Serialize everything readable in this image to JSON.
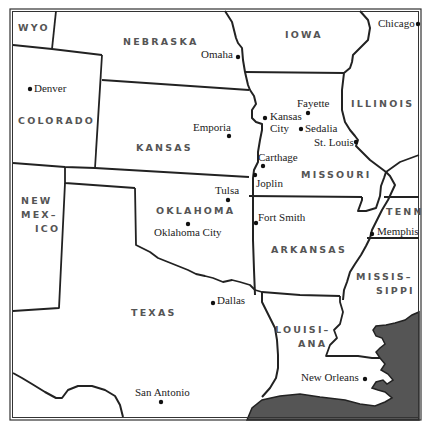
{
  "map": {
    "title": "South-Central United States",
    "colors": {
      "land": "#ffffff",
      "water": "#555555",
      "lines": "#222222",
      "state_label": "#555555"
    },
    "states": [
      {
        "name": "WYO",
        "lines": [
          "WYO"
        ]
      },
      {
        "name": "NEBRASKA",
        "lines": [
          "NEBRASKA"
        ]
      },
      {
        "name": "IOWA",
        "lines": [
          "IOWA"
        ]
      },
      {
        "name": "COLORADO",
        "lines": [
          "COLORADO"
        ]
      },
      {
        "name": "KANSAS",
        "lines": [
          "KANSAS"
        ]
      },
      {
        "name": "ILLINOIS",
        "lines": [
          "ILLINOIS"
        ]
      },
      {
        "name": "MISSOURI",
        "lines": [
          "MISSOURI"
        ]
      },
      {
        "name": "NEW MEXICO",
        "lines": [
          "NEW",
          "MEX–",
          "ICO"
        ]
      },
      {
        "name": "OKLAHOMA",
        "lines": [
          "OKLAHOMA"
        ]
      },
      {
        "name": "ARKANSAS",
        "lines": [
          "ARKANSAS"
        ]
      },
      {
        "name": "TENNESSEE",
        "lines": [
          "TENN"
        ]
      },
      {
        "name": "MISSISSIPPI",
        "lines": [
          "MISSIS–",
          "SIPPI"
        ]
      },
      {
        "name": "TEXAS",
        "lines": [
          "TEXAS"
        ]
      },
      {
        "name": "LOUISIANA",
        "lines": [
          "LOUISI–",
          "ANA"
        ]
      }
    ],
    "cities": [
      {
        "name": "Chicago",
        "lines": [
          "Chicago"
        ]
      },
      {
        "name": "Omaha",
        "lines": [
          "Omaha"
        ]
      },
      {
        "name": "Denver",
        "lines": [
          "Denver"
        ]
      },
      {
        "name": "Fayette",
        "lines": [
          "Fayette"
        ]
      },
      {
        "name": "Kansas City",
        "lines": [
          "Kansas",
          "City"
        ]
      },
      {
        "name": "Sedalia",
        "lines": [
          "Sedalia"
        ]
      },
      {
        "name": "Emporia",
        "lines": [
          "Emporia"
        ]
      },
      {
        "name": "St. Louis",
        "lines": [
          "St. Louis"
        ]
      },
      {
        "name": "Carthage",
        "lines": [
          "Carthage"
        ]
      },
      {
        "name": "Joplin",
        "lines": [
          "Joplin"
        ]
      },
      {
        "name": "Tulsa",
        "lines": [
          "Tulsa"
        ]
      },
      {
        "name": "Fort Smith",
        "lines": [
          "Fort Smith"
        ]
      },
      {
        "name": "Oklahoma City",
        "lines": [
          "Oklahoma City"
        ]
      },
      {
        "name": "Memphis",
        "lines": [
          "Memphis"
        ]
      },
      {
        "name": "Dallas",
        "lines": [
          "Dallas"
        ]
      },
      {
        "name": "New Orleans",
        "lines": [
          "New Orleans"
        ]
      },
      {
        "name": "San Antonio",
        "lines": [
          "San Antonio"
        ]
      }
    ]
  }
}
